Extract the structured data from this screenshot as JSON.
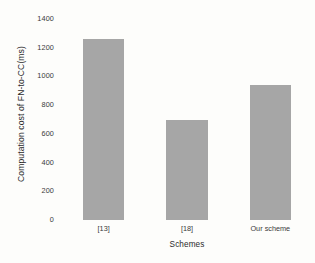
{
  "chart_data": {
    "type": "bar",
    "title": "",
    "subtitle": "",
    "categories": [
      "[13]",
      "[18]",
      "Our scheme"
    ],
    "values": [
      1260,
      700,
      940
    ],
    "xlabel": "Schemes",
    "ylabel": "Computation cost of FN-to-CC(ms)",
    "ylim": [
      0,
      1400
    ],
    "yticks": [
      1400,
      1200,
      1000,
      800,
      600,
      400,
      200,
      0
    ],
    "ytick_labels": [
      "1400",
      "1200",
      "1000",
      "800",
      "600",
      "400",
      "200",
      "0"
    ],
    "grid": false,
    "legend": null,
    "legend_position": "none",
    "series": [
      {
        "name": "Computation cost of FN-to-CC(ms)",
        "values": [
          1260,
          700,
          940
        ]
      }
    ],
    "colors": {
      "bar": "#a6a6a6",
      "background": "#fdfdfb",
      "text": "#3a3a3a"
    }
  }
}
